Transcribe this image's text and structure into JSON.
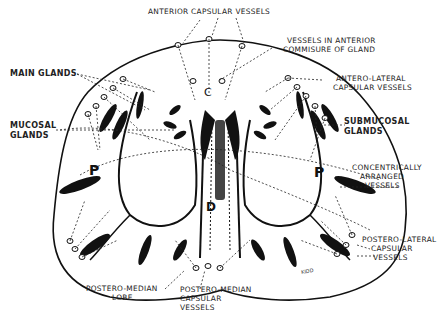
{
  "diagram": {
    "labels": {
      "anterior_capsular": "ANTERIOR CAPSULAR VESSELS",
      "vessels_commisure_1": "VESSELS IN ANTERIOR",
      "vessels_commisure_2": "COMMISURE OF GLAND",
      "main_glands": "MAIN GLANDS",
      "antero_lateral_1": "ANTERO-LATERAL",
      "antero_lateral_2": "CAPSULAR VESSELS",
      "mucosal_1": "MUCOSAL",
      "mucosal_2": "GLANDS",
      "submucosal_1": "SUBMUCOSAL",
      "submucosal_2": "GLANDS",
      "concentric_1": "CONCENTRICALLY",
      "concentric_2": "ARRANGED",
      "concentric_3": "VESSELS",
      "postero_lateral_1": "POSTERO-LATERAL",
      "postero_lateral_2": "CAPSULAR",
      "postero_lateral_3": "VESSELS",
      "postero_median_lobe_1": "POSTERO-MEDIAN",
      "postero_median_lobe_2": "LOBE",
      "postero_median_vessels_1": "POSTERO-MEDIAN",
      "postero_median_vessels_2": "CAPSULAR",
      "postero_median_vessels_3": "VESSELS"
    },
    "letters": {
      "left_lobe": "P",
      "right_lobe": "P",
      "center": "C",
      "duct": "D"
    },
    "signature": "KIDD"
  }
}
